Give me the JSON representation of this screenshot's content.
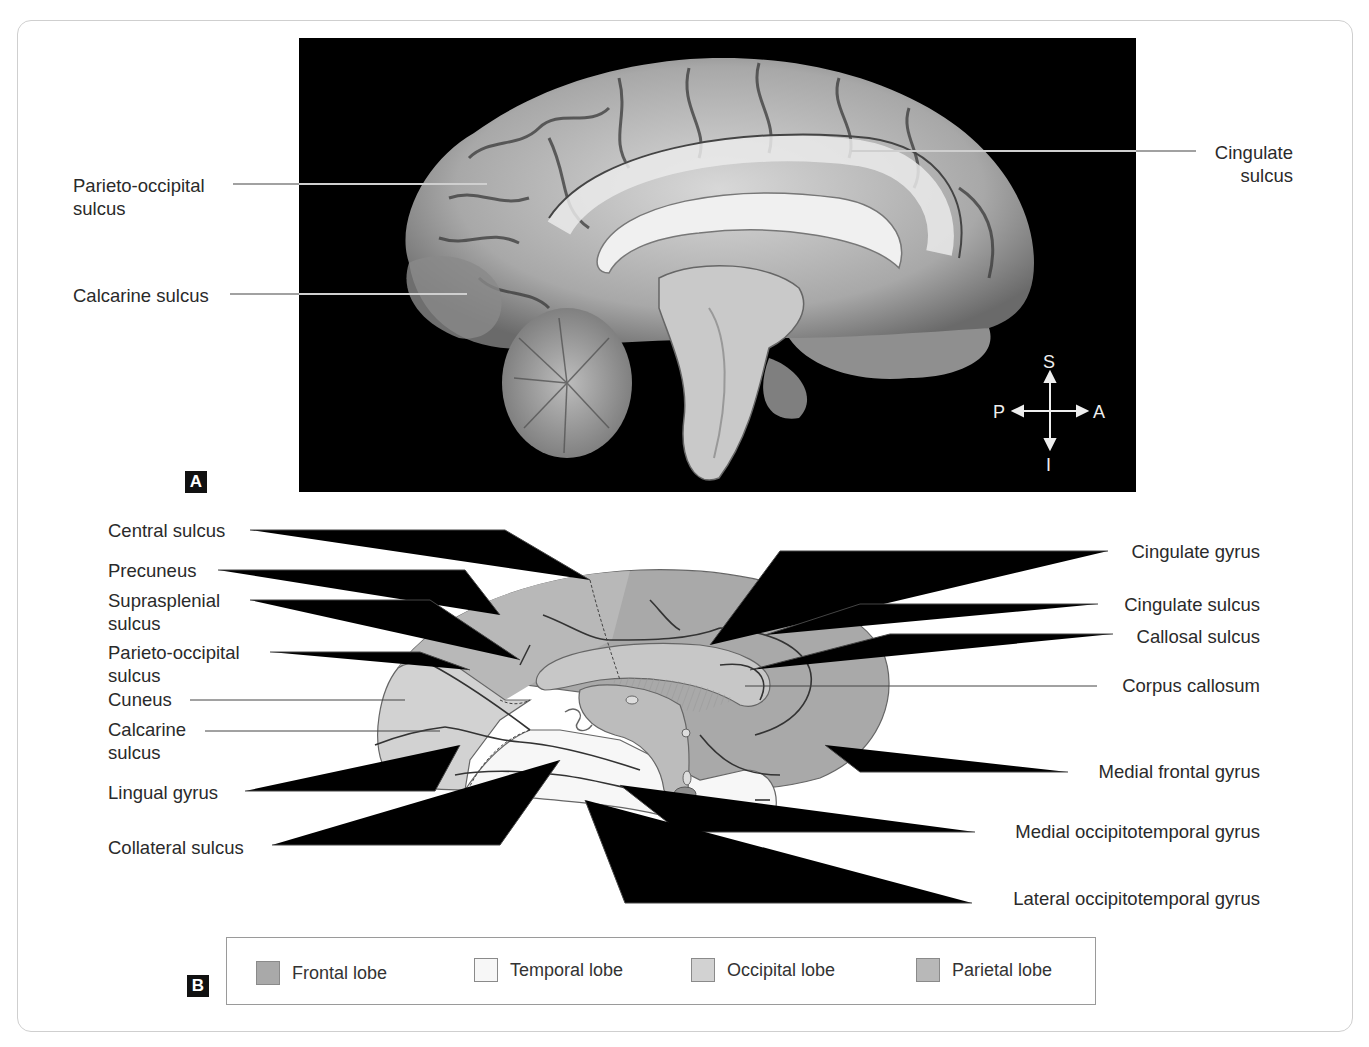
{
  "figure": {
    "panel_a": {
      "tag": "A",
      "labels": {
        "parieto_occipital": "Parieto-occipital\nsulcus",
        "calcarine": "Calcarine sulcus",
        "cingulate_sulcus": "Cingulate\nsulcus"
      },
      "compass": {
        "superior": "S",
        "inferior": "I",
        "posterior": "P",
        "anterior": "A"
      }
    },
    "panel_b": {
      "tag": "B",
      "left_labels": [
        "Central sulcus",
        "Precuneus",
        "Suprasplenial\nsulcus",
        "Parieto-occipital\nsulcus",
        "Cuneus",
        "Calcarine\nsulcus",
        "Lingual gyrus",
        "Collateral sulcus"
      ],
      "right_labels": [
        "Cingulate gyrus",
        "Cingulate sulcus",
        "Callosal sulcus",
        "Corpus callosum",
        "Medial frontal gyrus",
        "Medial occipitotemporal gyrus",
        "Lateral occipitotemporal gyrus"
      ]
    },
    "legend": {
      "items": [
        {
          "label": "Frontal lobe",
          "color": "#a9a9a9"
        },
        {
          "label": "Temporal lobe",
          "color": "#f7f7f7"
        },
        {
          "label": "Occipital lobe",
          "color": "#d2d2d2"
        },
        {
          "label": "Parietal lobe",
          "color": "#b8b8b8"
        }
      ]
    }
  }
}
